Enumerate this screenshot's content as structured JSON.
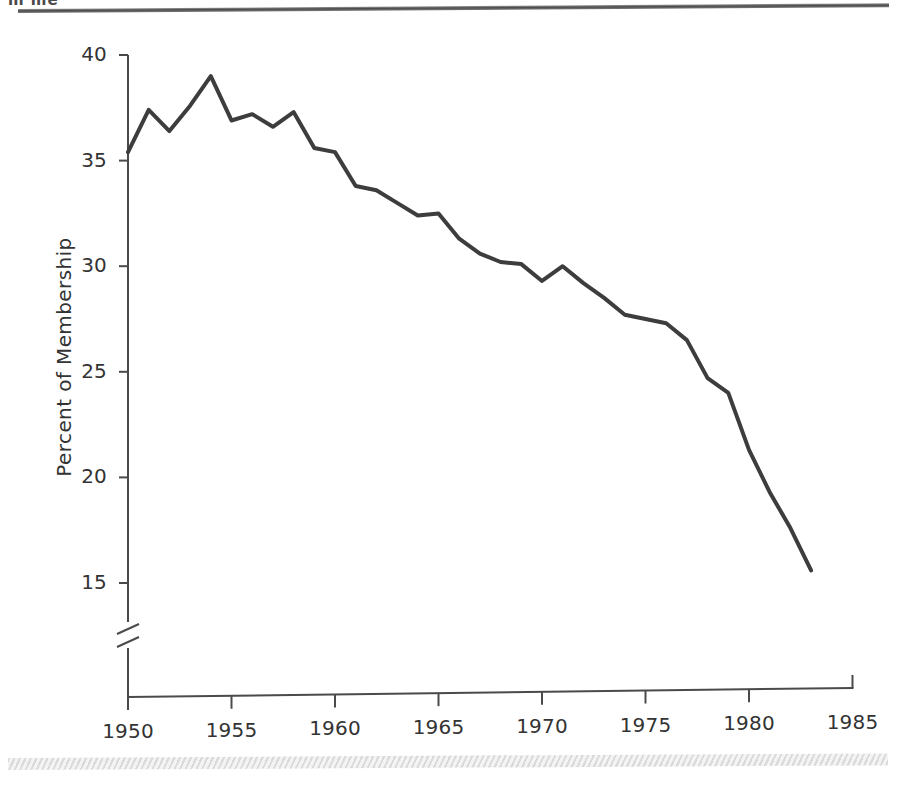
{
  "page": {
    "clipped_header_text": "m  me",
    "background_color": "#ffffff",
    "rule_color": "#4c4c4c"
  },
  "chart_data": {
    "type": "line",
    "title": "",
    "subtitle": "",
    "xlabel": "",
    "ylabel": "Percent of  Membership",
    "line_color": "#3d3d3d",
    "line_width": 4,
    "grid": false,
    "legend": null,
    "axis_break": {
      "present": true,
      "axis": "y",
      "note": "double slash break below 15 near the origin"
    },
    "xlim": [
      1950,
      1985
    ],
    "ylim": [
      15,
      40
    ],
    "xticks": [
      1950,
      1955,
      1960,
      1965,
      1970,
      1975,
      1980,
      1985
    ],
    "xtick_labels": [
      "1950",
      "1955",
      "1960",
      "1965",
      "1970",
      "1975",
      "1980",
      "1985"
    ],
    "yticks": [
      15,
      20,
      25,
      30,
      35,
      40
    ],
    "ytick_labels": [
      "15",
      "20",
      "25",
      "30",
      "35",
      "40"
    ],
    "x": [
      1950,
      1951,
      1952,
      1953,
      1954,
      1955,
      1956,
      1957,
      1958,
      1959,
      1960,
      1961,
      1962,
      1963,
      1964,
      1965,
      1966,
      1967,
      1968,
      1969,
      1970,
      1971,
      1972,
      1973,
      1974,
      1975,
      1976,
      1977,
      1978,
      1979,
      1980,
      1981,
      1982,
      1983
    ],
    "values": [
      35.4,
      37.4,
      36.4,
      37.6,
      39.0,
      36.9,
      37.2,
      36.6,
      37.3,
      35.6,
      35.4,
      33.8,
      33.6,
      33.0,
      32.4,
      32.5,
      31.3,
      30.6,
      30.2,
      30.1,
      29.3,
      30.0,
      29.2,
      28.5,
      27.7,
      27.5,
      27.3,
      26.5,
      24.7,
      24.0,
      21.3,
      19.3,
      17.6,
      15.6
    ],
    "annotations": []
  }
}
